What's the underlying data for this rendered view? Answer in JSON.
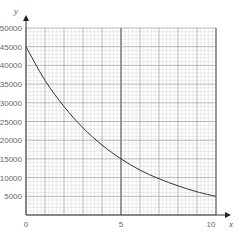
{
  "chart_data": {
    "type": "line",
    "title": "",
    "xlabel": "x",
    "ylabel": "y",
    "xlim": [
      0,
      10
    ],
    "ylim": [
      0,
      50000
    ],
    "x_ticks": [
      "0",
      "5",
      "10"
    ],
    "y_ticks": [
      "5000",
      "10000",
      "15000",
      "20000",
      "25000",
      "30000",
      "35000",
      "40000",
      "45000",
      "50000"
    ],
    "grid": true,
    "legend": null,
    "series": [
      {
        "name": "curve",
        "x": [
          0,
          1,
          2,
          3,
          4,
          5,
          6,
          7,
          8,
          9,
          10
        ],
        "values": [
          45000,
          36000,
          29000,
          23300,
          18700,
          15000,
          12000,
          9700,
          7800,
          6200,
          5000
        ]
      }
    ]
  },
  "labels": {
    "x_axis": "x",
    "y_axis": "y",
    "x_tick_0": "0",
    "x_tick_5": "5",
    "x_tick_10": "10"
  },
  "colors": {
    "grid_minor": "#d9d9d9",
    "grid_major": "#8c8c8c",
    "axis": "#333333",
    "curve": "#333333"
  }
}
